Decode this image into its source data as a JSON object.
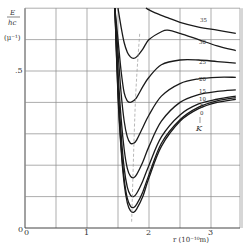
{
  "chart_data": {
    "type": "line",
    "title": "",
    "xlabel": "r (10^-10 m)",
    "ylabel": "E/hc (μ^-1)",
    "xlim": [
      0,
      3.5
    ],
    "ylim": [
      0,
      0.7
    ],
    "grid": true,
    "x_ticks": [
      {
        "value": 0,
        "label": "0"
      },
      {
        "value": 1,
        "label": "1"
      },
      {
        "value": 2,
        "label": "2"
      },
      {
        "value": 3,
        "label": "3"
      }
    ],
    "y_ticks": [
      {
        "value": 0,
        "label": "0"
      },
      {
        "value": 0.5,
        "label": ".5"
      }
    ],
    "legend_title": "K",
    "series": [
      {
        "name": "0",
        "x": [
          1.45,
          1.5,
          1.55,
          1.6,
          1.65,
          1.7,
          1.75,
          1.8,
          1.9,
          2.0,
          2.2,
          2.5,
          2.8,
          3.1,
          3.4
        ],
        "y": [
          0.7,
          0.42,
          0.25,
          0.14,
          0.08,
          0.055,
          0.05,
          0.06,
          0.1,
          0.16,
          0.26,
          0.34,
          0.38,
          0.4,
          0.41
        ]
      },
      {
        "name": "5",
        "x": [
          1.45,
          1.5,
          1.55,
          1.6,
          1.65,
          1.7,
          1.75,
          1.8,
          1.9,
          2.0,
          2.2,
          2.5,
          2.8,
          3.1,
          3.4
        ],
        "y": [
          0.7,
          0.43,
          0.26,
          0.155,
          0.095,
          0.07,
          0.065,
          0.075,
          0.115,
          0.17,
          0.27,
          0.345,
          0.385,
          0.405,
          0.415
        ]
      },
      {
        "name": "10",
        "x": [
          1.45,
          1.5,
          1.55,
          1.6,
          1.65,
          1.7,
          1.75,
          1.8,
          1.9,
          2.0,
          2.2,
          2.5,
          2.8,
          3.1,
          3.4
        ],
        "y": [
          0.7,
          0.46,
          0.3,
          0.19,
          0.13,
          0.105,
          0.1,
          0.11,
          0.15,
          0.2,
          0.29,
          0.36,
          0.395,
          0.41,
          0.42
        ]
      },
      {
        "name": "15",
        "x": [
          1.45,
          1.5,
          1.55,
          1.6,
          1.65,
          1.7,
          1.75,
          1.8,
          1.9,
          2.0,
          2.2,
          2.5,
          2.8,
          3.1,
          3.4
        ],
        "y": [
          0.7,
          0.5,
          0.35,
          0.25,
          0.19,
          0.165,
          0.16,
          0.17,
          0.21,
          0.26,
          0.34,
          0.4,
          0.425,
          0.435,
          0.44
        ]
      },
      {
        "name": "20",
        "x": [
          1.45,
          1.5,
          1.55,
          1.6,
          1.65,
          1.7,
          1.75,
          1.8,
          1.9,
          2.0,
          2.2,
          2.5,
          2.8,
          3.1,
          3.4
        ],
        "y": [
          0.7,
          0.56,
          0.43,
          0.34,
          0.29,
          0.27,
          0.27,
          0.28,
          0.32,
          0.36,
          0.42,
          0.46,
          0.475,
          0.48,
          0.48
        ]
      },
      {
        "name": "25",
        "x": [
          1.45,
          1.5,
          1.55,
          1.6,
          1.65,
          1.7,
          1.75,
          1.8,
          1.9,
          2.0,
          2.2,
          2.5,
          2.8,
          3.1,
          3.4
        ],
        "y": [
          0.7,
          0.6,
          0.5,
          0.43,
          0.405,
          0.4,
          0.405,
          0.415,
          0.45,
          0.48,
          0.52,
          0.535,
          0.535,
          0.53,
          0.525
        ]
      },
      {
        "name": "30",
        "x": [
          1.5,
          1.55,
          1.6,
          1.65,
          1.7,
          1.75,
          1.8,
          1.9,
          2.0,
          2.2,
          2.3,
          2.5,
          2.8,
          3.1,
          3.4
        ],
        "y": [
          0.7,
          0.64,
          0.59,
          0.56,
          0.545,
          0.54,
          0.545,
          0.57,
          0.6,
          0.625,
          0.63,
          0.62,
          0.6,
          0.58,
          0.565
        ]
      },
      {
        "name": "35",
        "x": [
          1.95,
          2.1,
          2.3,
          2.5,
          2.8,
          3.1,
          3.4
        ],
        "y": [
          0.7,
          0.685,
          0.67,
          0.655,
          0.64,
          0.63,
          0.62
        ]
      }
    ],
    "annotations": [
      {
        "type": "dashed-line",
        "description": "locus of minima",
        "x": [
          1.72,
          1.78,
          1.85
        ],
        "y": [
          0.02,
          0.4,
          0.62
        ]
      }
    ]
  },
  "labels": {
    "ylabel_top": "E",
    "ylabel_bottom": "hc",
    "ylabel_unit": "(μ⁻¹)",
    "y_half": ".5",
    "y_zero": "0",
    "x_zero": "0",
    "x_one": "1",
    "x_two": "2",
    "x_three": "3",
    "xlabel": "r (10⁻¹⁰m)",
    "k_label": "K",
    "curve_labels": [
      "35",
      "30",
      "25",
      "20",
      "15",
      "10",
      "5",
      "0"
    ]
  }
}
